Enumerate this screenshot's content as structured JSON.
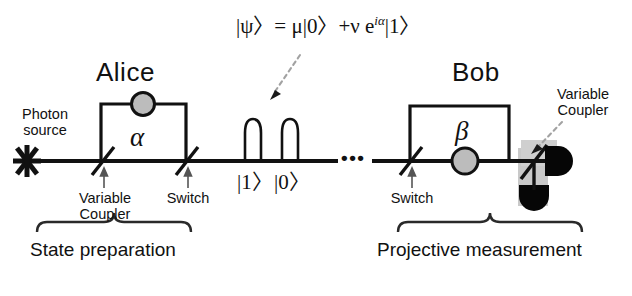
{
  "figure": {
    "title_alice": "Alice",
    "title_bob": "Bob",
    "state_formula": "|ψ〉= μ|0〉+ν e",
    "state_formula_exp": "iα",
    "state_formula_tail": "|1〉",
    "photon_source_label": "Photon\nsource",
    "alice_phase_symbol": "α",
    "bob_phase_symbol": "β",
    "alice_variable_coupler_label": "Variable\nCoupler",
    "alice_switch_label": "Switch",
    "bob_switch_label": "Switch",
    "bob_variable_coupler_label": "Variable\nCoupler",
    "pulse_ket_one": "|1〉",
    "pulse_ket_zero": "|0〉",
    "ellipsis": "•••",
    "state_preparation_label": "State preparation",
    "projective_measurement_label": "Projective measurement",
    "colors": {
      "line": "#111111",
      "phase_circle_fill": "#b9b9b9",
      "detector_fill": "#000000",
      "shadow_fill": "#c8c8c8",
      "background": "#ffffff",
      "arrow_dash": "#9a9a9a"
    }
  }
}
